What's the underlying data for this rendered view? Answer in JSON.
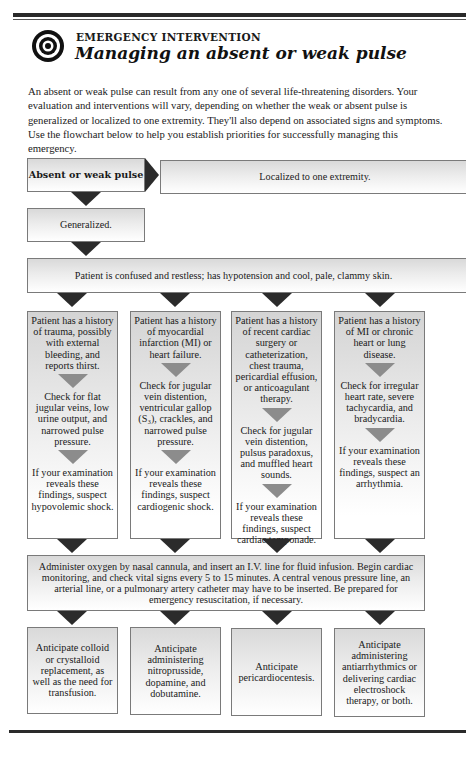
{
  "header": {
    "kicker": "EMERGENCY INTERVENTION",
    "title": "Managing an absent or weak pulse",
    "icon": "target-icon"
  },
  "intro": "An absent or weak pulse can result from any one of several life-threatening disorders. Your evaluation and interventions will vary, depending on whether the weak or absent pulse is generalized or localized to one extremity. They'll also depend on associated signs and symptoms. Use the flowchart below to help you establish priorities for successfully managing this emergency.",
  "flowchart": {
    "start": "Absent or weak pulse",
    "localized": "Localized to one extremity.",
    "generalized": "Generalized.",
    "presentation": "Patient is confused and restless; has hypotension and cool, pale, clammy skin.",
    "columns": [
      {
        "history": "Patient has a history of trauma, possibly with external bleeding, and reports thirst.",
        "check": "Check for flat jugular veins, low urine output, and narrowed pulse pressure.",
        "suspect": "If your examination reveals these findings, suspect hypovolemic shock.",
        "anticipate": "Anticipate colloid or crystalloid replacement, as well as the need for transfusion."
      },
      {
        "history": "Patient has a history of myocardial infarction (MI) or heart failure.",
        "check": "Check for jugular vein distention, ventricular gallop (S₃), crackles, and narrowed pulse pressure.",
        "suspect": "If your examination reveals these findings, suspect cardiogenic shock.",
        "anticipate": "Anticipate administering nitroprusside, dopamine, and dobutamine."
      },
      {
        "history": "Patient has a history of recent cardiac surgery or catheterization, chest trauma, pericardial effusion, or anticoagulant therapy.",
        "check": "Check for jugular vein distention, pulsus paradoxus, and muffled heart sounds.",
        "suspect": "If your examination reveals these findings, suspect cardiac tamponade.",
        "anticipate": "Anticipate pericardiocentesis."
      },
      {
        "history": "Patient has a history of MI or chronic heart or lung disease.",
        "check": "Check for irregular heart rate, severe tachycardia, and bradycardia.",
        "suspect": "If your examination reveals these findings, suspect an arrhythmia.",
        "anticipate": "Anticipate administering antiarrhythmics or delivering cardiac electroshock therapy, or both."
      }
    ],
    "common_intervention": "Administer oxygen by nasal cannula, and insert an I.V. line for fluid infusion. Begin cardiac monitoring, and check vital signs every 5 to 15 minutes. A central venous pressure line, an arterial line, or a pulmonary artery catheter may have to be inserted. Be prepared for emergency resuscitation, if necessary."
  },
  "colors": {
    "arrow": "#2b2b2b",
    "mini_arrow": "#8c8c8c",
    "box_border": "#7a7a7a",
    "box_fill_top": "#d9d9d9"
  }
}
